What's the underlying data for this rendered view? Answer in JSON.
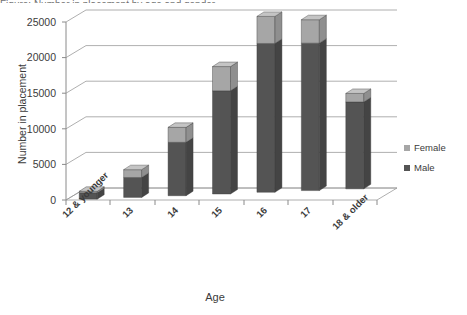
{
  "title_sliver": "Figure: Number in placement by age and gender",
  "chart_data": {
    "type": "bar",
    "subtype": "stacked-3d-column",
    "title": "",
    "xlabel": "Age",
    "ylabel": "Number in placement",
    "categories": [
      "12 & younger",
      "13",
      "14",
      "15",
      "16",
      "17",
      "18 & older"
    ],
    "series": [
      {
        "name": "Male",
        "color": "#545454",
        "values": [
          900,
          2800,
          7500,
          14500,
          20900,
          20700,
          12200
        ]
      },
      {
        "name": "Female",
        "color": "#a6a6a6",
        "values": [
          200,
          1100,
          2100,
          3400,
          3800,
          3300,
          1200
        ]
      }
    ],
    "totals": [
      1100,
      3900,
      9600,
      17900,
      24700,
      24000,
      13400
    ],
    "ylim": [
      0,
      25000
    ],
    "yticks": [
      0,
      5000,
      10000,
      15000,
      20000,
      25000
    ],
    "ytick_labels": [
      "0",
      "5000",
      "10000",
      "15000",
      "20000",
      "25000"
    ],
    "grid": true,
    "grid_axis": "y",
    "legend_position": "right",
    "legend_entries": [
      "Female",
      "Male"
    ]
  },
  "colors": {
    "female": "#a6a6a6",
    "female_top": "#c4c4c4",
    "female_side": "#8f8f8f",
    "male": "#545454",
    "male_top": "#6e6e6e",
    "male_side": "#444444",
    "grid": "#9a9a9a",
    "axis": "#8a8a8a",
    "floor": "#ffffff",
    "text": "#3b3b3b",
    "background": "#ffffff"
  }
}
